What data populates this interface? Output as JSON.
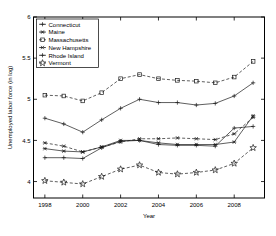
{
  "chart_data": {
    "type": "line",
    "title": "",
    "xlabel": "Year",
    "ylabel": "Unemployed labor force (in log)",
    "xlim": [
      1997.4,
      2009.6
    ],
    "ylim": [
      3.8,
      6.0
    ],
    "xticks": [
      1998,
      2000,
      2002,
      2004,
      2006,
      2008
    ],
    "xtick_labels": [
      "1998",
      "2000",
      "2002",
      "2004",
      "2006",
      "2008"
    ],
    "yticks": [
      4,
      4.5,
      5,
      5.5,
      6
    ],
    "ytick_labels": [
      "4",
      "4.5",
      "5",
      "5.5",
      "6"
    ],
    "grid": false,
    "legend_position": "top-left",
    "x": [
      1998,
      1999,
      2000,
      2001,
      2002,
      2003,
      2004,
      2005,
      2006,
      2007,
      2008,
      2009
    ],
    "series": [
      {
        "name": "Connecticut",
        "marker": "plus",
        "linestyle": "solid",
        "values": [
          4.77,
          4.7,
          4.6,
          4.75,
          4.89,
          5.0,
          4.96,
          4.96,
          4.93,
          4.95,
          5.04,
          5.2
        ]
      },
      {
        "name": "Maine",
        "marker": "asterisk",
        "linestyle": "solid",
        "values": [
          4.4,
          4.37,
          4.36,
          4.42,
          4.5,
          4.5,
          4.47,
          4.45,
          4.45,
          4.45,
          4.48,
          4.8
        ]
      },
      {
        "name": "Massachusetts",
        "marker": "square",
        "linestyle": "dashed",
        "values": [
          5.05,
          5.04,
          4.98,
          5.08,
          5.25,
          5.3,
          5.25,
          5.23,
          5.22,
          5.2,
          5.27,
          5.46
        ]
      },
      {
        "name": "New Hampshire",
        "marker": "asterisk",
        "linestyle": "dashed",
        "values": [
          4.47,
          4.43,
          4.36,
          4.42,
          4.48,
          4.52,
          4.52,
          4.53,
          4.52,
          4.51,
          4.58,
          4.78
        ]
      },
      {
        "name": "Rhode Island",
        "marker": "plus",
        "linestyle": "solid",
        "values": [
          4.29,
          4.29,
          4.28,
          4.41,
          4.49,
          4.5,
          4.45,
          4.44,
          4.44,
          4.43,
          4.65,
          4.67
        ]
      },
      {
        "name": "Vermont",
        "marker": "star",
        "linestyle": "dashed",
        "values": [
          4.01,
          3.99,
          3.97,
          4.06,
          4.15,
          4.2,
          4.11,
          4.09,
          4.11,
          4.14,
          4.22,
          4.41
        ]
      }
    ],
    "legend_entries": [
      "Connecticut",
      "Maine",
      "Massachusetts",
      "New Hampshire",
      "Rhode Island",
      "Vermont"
    ],
    "colors": {
      "line": "#1a1a1a",
      "axis": "#000000",
      "background": "#ffffff"
    }
  }
}
